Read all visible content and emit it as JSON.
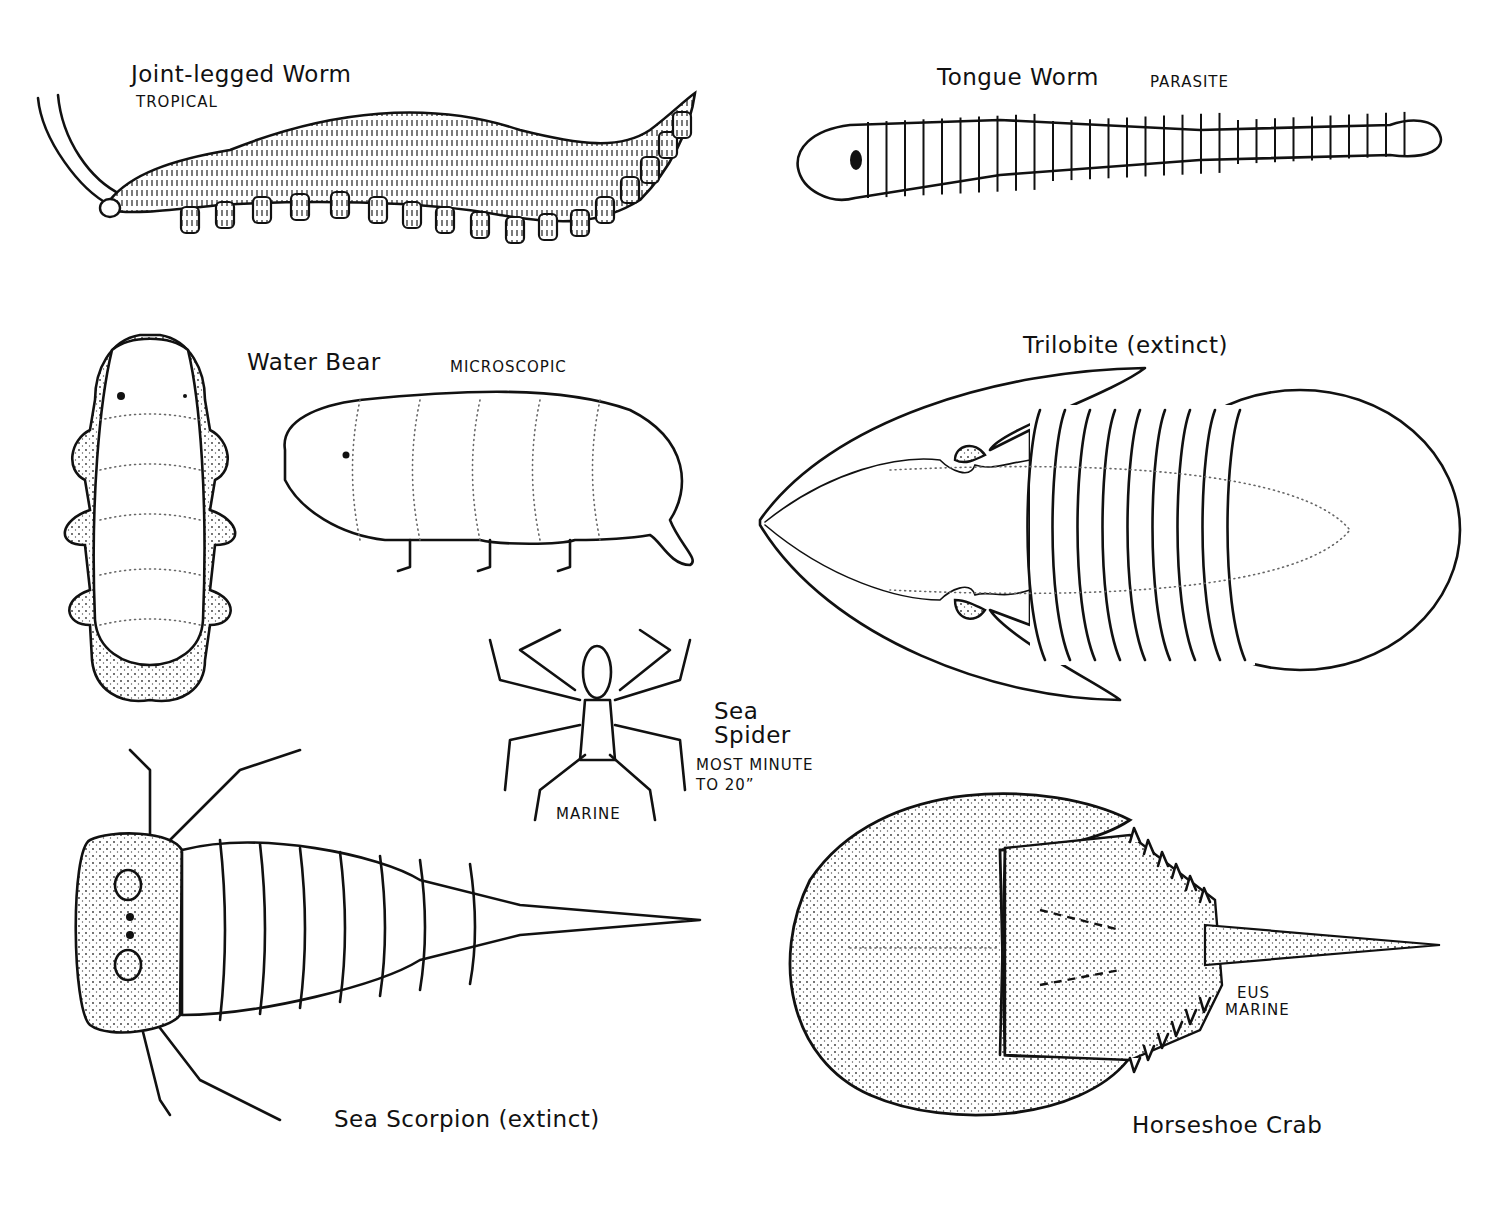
{
  "plate": {
    "creatures": [
      {
        "id": "joint-legged-worm",
        "name": "Joint-legged Worm",
        "note": "TROPICAL"
      },
      {
        "id": "tongue-worm",
        "name": "Tongue Worm",
        "note": "PARASITE"
      },
      {
        "id": "water-bear",
        "name": "Water Bear",
        "note": "MICROSCOPIC"
      },
      {
        "id": "trilobite",
        "name": "Trilobite (extinct)",
        "note": ""
      },
      {
        "id": "sea-spider",
        "name_line1": "Sea",
        "name_line2": "Spider",
        "note_line1": "MOST MINUTE",
        "note_line2": "TO 20”",
        "habitat": "MARINE"
      },
      {
        "id": "sea-scorpion",
        "name": "Sea Scorpion (extinct)",
        "note": ""
      },
      {
        "id": "horseshoe-crab",
        "name": "Horseshoe Crab",
        "note_line1": "EUS",
        "note_line2": "MARINE"
      }
    ]
  },
  "colors": {
    "ink": "#111111",
    "paper": "#ffffff"
  }
}
